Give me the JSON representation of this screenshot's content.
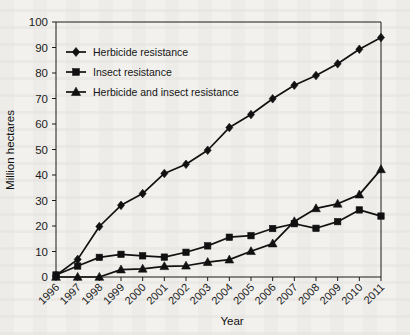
{
  "chart_data": {
    "type": "line",
    "title": "",
    "xlabel": "Year",
    "ylabel": "Million hectares",
    "categories": [
      "1996",
      "1997",
      "1998",
      "1999",
      "2000",
      "2001",
      "2002",
      "2003",
      "2004",
      "2005",
      "2006",
      "2007",
      "2008",
      "2009",
      "2010",
      "2011"
    ],
    "xlim": [
      1996,
      2011
    ],
    "ylim": [
      0,
      100
    ],
    "ytick_step": 10,
    "yticks": [
      0,
      10,
      20,
      30,
      40,
      50,
      60,
      70,
      80,
      90,
      100
    ],
    "grid": false,
    "legend_position": "top-left",
    "series": [
      {
        "name": "Herbicide resistance",
        "marker": "diamond",
        "color": "#111111",
        "values": [
          0.6,
          6.9,
          19.8,
          28.1,
          32.7,
          40.6,
          44.2,
          49.7,
          58.6,
          63.7,
          69.9,
          75.2,
          79.0,
          83.6,
          89.3,
          93.9
        ]
      },
      {
        "name": "Insect resistance",
        "marker": "square",
        "color": "#111111",
        "values": [
          0.8,
          4.3,
          7.7,
          8.9,
          8.3,
          7.8,
          9.7,
          12.2,
          15.6,
          16.2,
          19.0,
          20.9,
          19.1,
          21.7,
          26.3,
          23.9
        ]
      },
      {
        "name": "Herbicide and insect resistance",
        "marker": "triangle",
        "color": "#111111",
        "values": [
          0.0,
          0.0,
          0.0,
          2.9,
          3.2,
          4.2,
          4.4,
          5.8,
          6.8,
          10.1,
          13.1,
          21.8,
          26.9,
          28.7,
          32.3,
          42.2
        ]
      }
    ]
  },
  "legend": {
    "items": [
      {
        "label": "Herbicide resistance",
        "marker": "diamond"
      },
      {
        "label": "Insect resistance",
        "marker": "square"
      },
      {
        "label": "Herbicide and insect resistance",
        "marker": "triangle"
      }
    ]
  },
  "axes": {
    "y_title": "Million hectares",
    "x_title": "Year"
  }
}
